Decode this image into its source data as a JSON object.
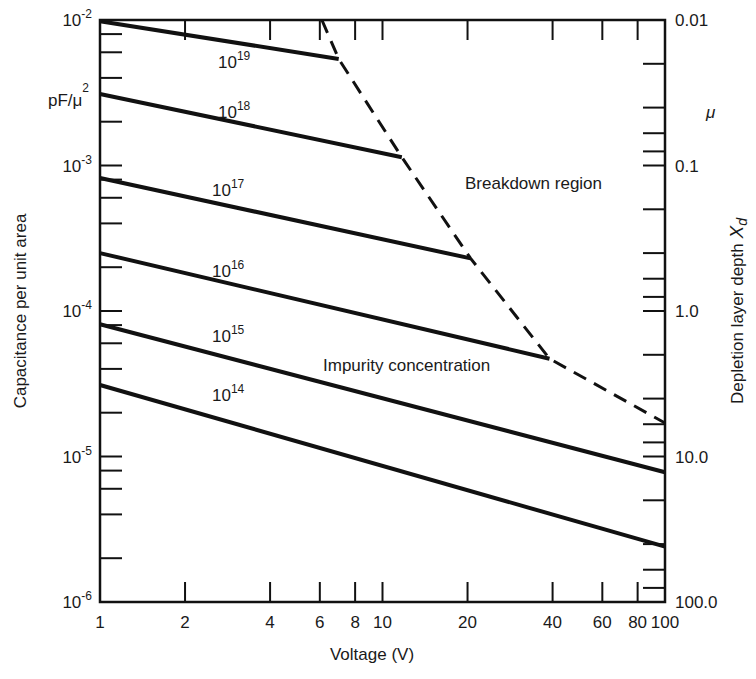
{
  "chart_data": {
    "type": "line",
    "title": "",
    "xlabel": "Voltage (V)",
    "ylabel": "Capacitance per unit area",
    "ylabel_units": "pF/μ²",
    "y2label": "Depletion layer depth X_d",
    "y2label_units": "μ",
    "xscale": "log",
    "yscale": "log",
    "xlim": [
      1,
      100
    ],
    "ylim": [
      1e-06,
      0.01
    ],
    "y2lim": [
      0.01,
      100.0
    ],
    "grid": false,
    "x_ticks": [
      {
        "value": 1,
        "label": "1"
      },
      {
        "value": 2,
        "label": "2"
      },
      {
        "value": 4,
        "label": "4"
      },
      {
        "value": 6,
        "label": "6"
      },
      {
        "value": 8,
        "label": "8"
      },
      {
        "value": 10,
        "label": "10"
      },
      {
        "value": 20,
        "label": "20"
      },
      {
        "value": 40,
        "label": "40"
      },
      {
        "value": 60,
        "label": "60"
      },
      {
        "value": 80,
        "label": "80"
      },
      {
        "value": 100,
        "label": "100"
      }
    ],
    "y_ticks": [
      {
        "value": 0.01,
        "base": "10",
        "exp": "-2"
      },
      {
        "value": 0.001,
        "base": "10",
        "exp": "-3"
      },
      {
        "value": 0.0001,
        "base": "10",
        "exp": "-4"
      },
      {
        "value": 1e-05,
        "base": "10",
        "exp": "-5"
      },
      {
        "value": 1e-06,
        "base": "10",
        "exp": "-6"
      }
    ],
    "y2_ticks": [
      {
        "value": 0.01,
        "label": "0.01"
      },
      {
        "value": 0.1,
        "label": "0.1"
      },
      {
        "value": 1.0,
        "label": "1.0"
      },
      {
        "value": 10.0,
        "label": "10.0"
      },
      {
        "value": 100.0,
        "label": "100.0"
      }
    ],
    "series": [
      {
        "name": "10^19",
        "base": "10",
        "exp": "19",
        "style": "solid",
        "points": [
          [
            1,
            0.0098
          ],
          [
            7,
            0.0054
          ]
        ]
      },
      {
        "name": "10^18",
        "base": "10",
        "exp": "18",
        "style": "solid",
        "points": [
          [
            1,
            0.0031
          ],
          [
            11.7,
            0.00114
          ]
        ]
      },
      {
        "name": "10^17",
        "base": "10",
        "exp": "17",
        "style": "solid",
        "points": [
          [
            1,
            0.00082
          ],
          [
            20.5,
            0.00023
          ]
        ]
      },
      {
        "name": "10^16",
        "base": "10",
        "exp": "16",
        "style": "solid",
        "points": [
          [
            1,
            0.00025
          ],
          [
            39,
            4.7e-05
          ]
        ]
      },
      {
        "name": "10^15",
        "base": "10",
        "exp": "15",
        "style": "solid",
        "points": [
          [
            1,
            8.1e-05
          ],
          [
            100,
            7.8e-06
          ]
        ]
      },
      {
        "name": "10^14",
        "base": "10",
        "exp": "14",
        "style": "solid",
        "points": [
          [
            1,
            3.1e-05
          ],
          [
            100,
            2.4e-06
          ]
        ]
      },
      {
        "name": "Breakdown boundary",
        "style": "dashed",
        "points": [
          [
            6.1,
            0.01
          ],
          [
            7,
            0.0054
          ],
          [
            11.7,
            0.00114
          ],
          [
            20.5,
            0.00023
          ],
          [
            39,
            4.7e-05
          ],
          [
            100,
            1.7e-05
          ]
        ]
      }
    ],
    "annotations": [
      {
        "text": "Breakdown region"
      },
      {
        "text": "Impurity concentration"
      }
    ]
  }
}
